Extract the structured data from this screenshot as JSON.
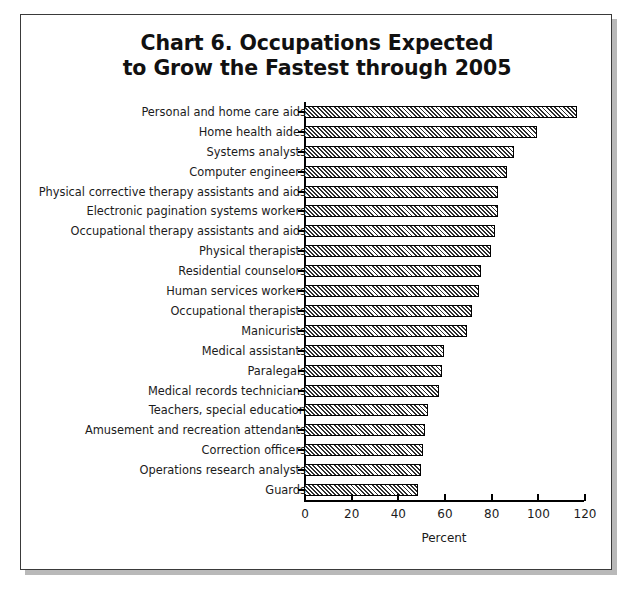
{
  "chart_data": {
    "type": "bar",
    "orientation": "horizontal",
    "title": "Chart 6. Occupations Expected\nto Grow the Fastest through 2005",
    "xlabel": "Percent",
    "ylabel": "",
    "xlim": [
      0,
      120
    ],
    "xticks": [
      0,
      20,
      40,
      60,
      80,
      100,
      120
    ],
    "xtick_labels": [
      "0",
      "20",
      "40",
      "60",
      "80",
      "100",
      "120"
    ],
    "grid": false,
    "legend": false,
    "bar_fill": "diagonal-hatch",
    "bar_edge_color": "#000000",
    "categories": [
      "Personal and home care aids",
      "Home health aides",
      "Systems analysts",
      "Computer engineers",
      "Physical corrective therapy assistants and aids",
      "Electronic pagination systems workers",
      "Occupational therapy assistants and aids",
      "Physical therapists",
      "Residential counselors",
      "Human services workers",
      "Occupational therapists",
      "Manicurists",
      "Medical assistants",
      "Paralegals",
      "Medical records technicians",
      "Teachers, special education",
      "Amusement and recreation attendants",
      "Correction officers",
      "Operations research analysts",
      "Guards"
    ],
    "values": [
      117,
      100,
      90,
      87,
      83,
      83,
      82,
      80,
      76,
      75,
      72,
      70,
      60,
      59,
      58,
      53,
      52,
      51,
      50,
      49
    ]
  },
  "figure": {
    "background_color": "#ffffff",
    "frame_color": "#3a3a3a",
    "shadow_color": "#b9b9b9",
    "text_color": "#1b1b1b"
  }
}
